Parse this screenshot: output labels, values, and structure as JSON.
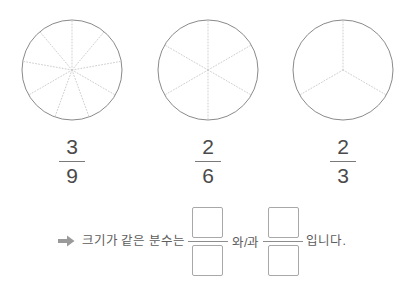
{
  "page": {
    "background_color": "#ffffff",
    "ink_color": "#555555",
    "sector_line_color": "#cfcfcf",
    "circle_outline_color": "#8a8a8a"
  },
  "models": [
    {
      "id": "circle-nine",
      "sectors": 9,
      "start_angle_deg": 90,
      "center_x": 72,
      "center_y": 72,
      "radius": 50,
      "fraction": {
        "numerator": "3",
        "denominator": "9"
      }
    },
    {
      "id": "circle-six",
      "sectors": 6,
      "start_angle_deg": 90,
      "center_x": 208,
      "center_y": 72,
      "radius": 50,
      "fraction": {
        "numerator": "2",
        "denominator": "6"
      }
    },
    {
      "id": "circle-three",
      "sectors": 3,
      "start_angle_deg": 90,
      "center_x": 343,
      "center_y": 72,
      "radius": 50,
      "fraction": {
        "numerator": "2",
        "denominator": "3"
      }
    }
  ],
  "prompt": {
    "arrow_icon": "arrow-right-icon",
    "lead_text": "크기가 같은 분수는",
    "joiner_text": "와/과",
    "trailing_text": "입니다.",
    "answer_slots": [
      {
        "numerator": "",
        "denominator": ""
      },
      {
        "numerator": "",
        "denominator": ""
      }
    ]
  }
}
